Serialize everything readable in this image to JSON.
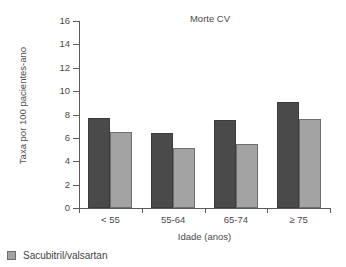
{
  "chart_data": {
    "type": "bar",
    "title": "Morte CV",
    "xlabel": "Idade (anos)",
    "ylabel": "Taxa por 100 pacientes-ano",
    "categories": [
      "< 55",
      "55-64",
      "65-74",
      "≥ 75"
    ],
    "series": [
      {
        "name": "",
        "color": "#4a4a4a",
        "values": [
          7.7,
          6.4,
          7.5,
          9.1
        ]
      },
      {
        "name": "Sacubitril/valsartan",
        "color": "#a3a3a3",
        "values": [
          6.5,
          5.1,
          5.45,
          7.6
        ]
      }
    ],
    "ylim": [
      0,
      16
    ],
    "yticks": [
      0,
      2,
      4,
      6,
      8,
      10,
      12,
      14,
      16
    ],
    "ytick_labels": [
      "0",
      "2",
      "4",
      "6",
      "8",
      "10",
      "12",
      "14",
      "16"
    ],
    "grid": false,
    "legend_position": "below-left"
  },
  "legend": {
    "entries": [
      {
        "label": "Sacubitril/valsartan",
        "color": "#a3a3a3"
      }
    ]
  }
}
